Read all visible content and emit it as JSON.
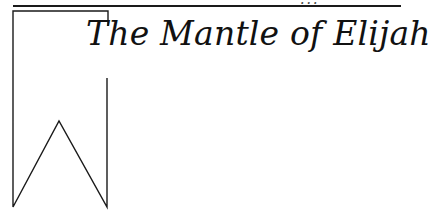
{
  "header": {
    "clipped_text": "..."
  },
  "chapter": {
    "title": "The Mantle of Elijah"
  },
  "decoration": {
    "banner_icon": "bookmark-banner-icon",
    "line_color": "#1a1a1a"
  }
}
